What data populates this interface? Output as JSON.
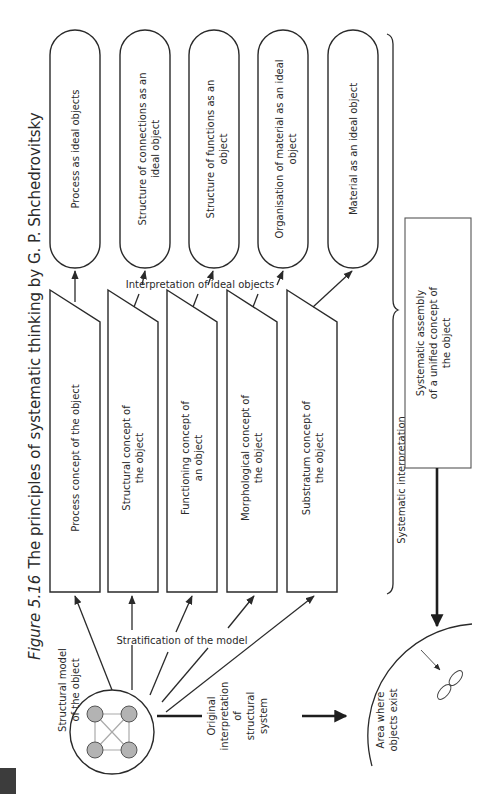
{
  "figure": {
    "number": "Figure 5.16",
    "title": "The principles of systematic thinking by G. P. Shchedrovitsky"
  },
  "ideal_objects": [
    {
      "line1": "Process as ideal objects",
      "line2": ""
    },
    {
      "line1": "Structure of connections as an",
      "line2": "ideal object"
    },
    {
      "line1": "Structure of functions as an",
      "line2": "object"
    },
    {
      "line1": "Organisation of material as an ideal",
      "line2": "object"
    },
    {
      "line1": "Material as an ideal object",
      "line2": ""
    }
  ],
  "concepts": [
    {
      "line1": "Process concept of the object",
      "line2": ""
    },
    {
      "line1": "Structural concept of",
      "line2": "the object"
    },
    {
      "line1": "Functioning concept of",
      "line2": "an object"
    },
    {
      "line1": "Morphological concept of",
      "line2": "the object"
    },
    {
      "line1": "Substratum concept of",
      "line2": "the object"
    }
  ],
  "labels": {
    "interpretation": "Interpretation of ideal objects",
    "stratification": "Stratification of the model",
    "structural_model_1": "Structural model",
    "structural_model_2": "of the object",
    "original_1": "Original",
    "original_2": "interpretation",
    "original_3": "of",
    "original_4": "structural",
    "original_5": "system",
    "systematic_interpretation": "Systematic interpretation",
    "assembly_1": "Systematic assembly",
    "assembly_2": "of a unified concept of",
    "assembly_3": "the object",
    "area_1": "Area where",
    "area_2": "objects exist"
  },
  "colors": {
    "ink": "#2a2a2a",
    "node_fill": "#b3b3b3",
    "page_tab": "#3c3c3c"
  }
}
